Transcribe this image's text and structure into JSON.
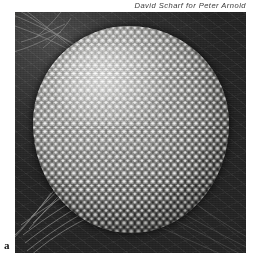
{
  "figure": {
    "panel_letter": "a",
    "photo_credit": "David Scharf for Peter Arnold",
    "plate": {
      "left": 15,
      "top": 12,
      "width": 231,
      "height": 241
    },
    "colors": {
      "page_background": "#ffffff",
      "plate_background": "#2b2b2b",
      "credit_text": "#3a3a3a",
      "panel_letter": "#141414",
      "eye_highlight": "#e8e8e6",
      "eye_midtone": "#8e8e8c",
      "eye_shadow": "#343433"
    },
    "elements": {
      "eye_label": "compound eye",
      "facets_label": "ommatidia",
      "bristles_label": "bristles"
    }
  }
}
